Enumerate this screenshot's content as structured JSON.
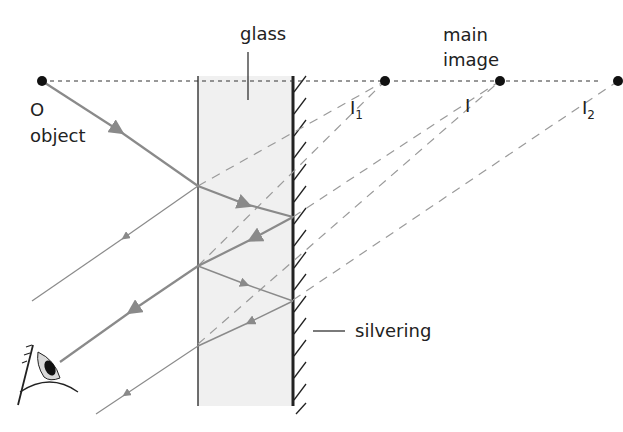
{
  "diagram": {
    "labels": {
      "glass": "glass",
      "main_image_line1": "main",
      "main_image_line2": "image",
      "object_letter": "O",
      "object_word": "object",
      "image1_base": "I",
      "image1_sub": "1",
      "image_main": "I",
      "image2_base": "I",
      "image2_sub": "2",
      "silvering": "silvering"
    },
    "colors": {
      "ray": "#8a8a8a",
      "virtual_ray": "#9a9a9a",
      "glass_fill": "#f0f0f0",
      "outline": "#222222"
    },
    "nodes": [
      "object O",
      "image I1",
      "main image I",
      "image I2",
      "glass slab",
      "silvering",
      "eye"
    ]
  }
}
